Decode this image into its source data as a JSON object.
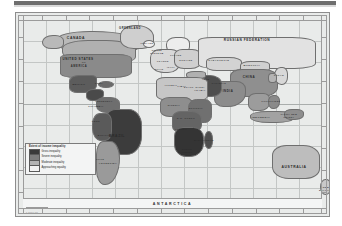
{
  "document": {
    "type": "world-choropleth-map",
    "subject": "Extent of income inequality"
  },
  "topbar": {
    "present": true
  },
  "legend": {
    "title": "Extent of income inequality",
    "entries": [
      {
        "label": "Gross inequality",
        "color": "#3a3a3a"
      },
      {
        "label": "Severe inequality",
        "color": "#7c7c7c"
      },
      {
        "label": "Moderate inequality",
        "color": "#b4b4b4"
      },
      {
        "label": "Approaching equality",
        "color": "#f2f2f2"
      }
    ]
  },
  "map": {
    "background_color": "#e9ebea",
    "graticule_color": "#c3c6c5",
    "antarctica_label": "ANTARCTICA",
    "scale_credit": "0        2000 km",
    "source_credit": "",
    "labels": [
      {
        "text": "CANADA",
        "x": 60,
        "y": 26,
        "size": 3.4
      },
      {
        "text": "UNITED STATES",
        "x": 62,
        "y": 46,
        "size": 3.0
      },
      {
        "text": "OF",
        "x": 68,
        "y": 50,
        "size": 2.4
      },
      {
        "text": "AMERICA",
        "x": 63,
        "y": 54,
        "size": 2.6
      },
      {
        "text": "GREENLAND",
        "x": 114,
        "y": 16,
        "size": 2.6
      },
      {
        "text": "ICELAND",
        "x": 131,
        "y": 30,
        "size": 2.0
      },
      {
        "text": "MEXICO",
        "x": 63,
        "y": 72,
        "size": 2.4
      },
      {
        "text": "CUBA",
        "x": 83,
        "y": 70,
        "size": 2.0
      },
      {
        "text": "VENEZUELA",
        "x": 88,
        "y": 88,
        "size": 2.0
      },
      {
        "text": "COLOMBIA",
        "x": 80,
        "y": 93,
        "size": 2.0
      },
      {
        "text": "PERU",
        "x": 80,
        "y": 108,
        "size": 2.0
      },
      {
        "text": "BRAZIL",
        "x": 101,
        "y": 124,
        "size": 3.4
      },
      {
        "text": "BOLIVIA",
        "x": 88,
        "y": 122,
        "size": 2.0
      },
      {
        "text": "CHILE",
        "x": 84,
        "y": 146,
        "size": 2.0
      },
      {
        "text": "ARGENTINA",
        "x": 92,
        "y": 150,
        "size": 2.2
      },
      {
        "text": "UNITED",
        "x": 141,
        "y": 38,
        "size": 1.9
      },
      {
        "text": "KINGDOM",
        "x": 141,
        "y": 41,
        "size": 1.9
      },
      {
        "text": "FRANCE",
        "x": 147,
        "y": 48,
        "size": 2.0
      },
      {
        "text": "SPAIN",
        "x": 143,
        "y": 56,
        "size": 2.0
      },
      {
        "text": "ITALY",
        "x": 155,
        "y": 55,
        "size": 1.9
      },
      {
        "text": "POLAND",
        "x": 160,
        "y": 43,
        "size": 1.9
      },
      {
        "text": "UKRAINE",
        "x": 170,
        "y": 47,
        "size": 2.0
      },
      {
        "text": "RUSSIAN FEDERATION",
        "x": 231,
        "y": 28,
        "size": 3.2
      },
      {
        "text": "KAZAKHSTAN",
        "x": 203,
        "y": 47,
        "size": 2.2
      },
      {
        "text": "MONGOLIA",
        "x": 236,
        "y": 52,
        "size": 2.2
      },
      {
        "text": "CHINA",
        "x": 233,
        "y": 64,
        "size": 3.0
      },
      {
        "text": "JAPAN",
        "x": 263,
        "y": 62,
        "size": 2.2
      },
      {
        "text": "INDIA",
        "x": 212,
        "y": 78,
        "size": 2.8
      },
      {
        "text": "PAKISTAN",
        "x": 203,
        "y": 70,
        "size": 2.0
      },
      {
        "text": "IRAN",
        "x": 190,
        "y": 66,
        "size": 2.0
      },
      {
        "text": "SAUDI",
        "x": 184,
        "y": 74,
        "size": 2.0
      },
      {
        "text": "ARABIA",
        "x": 184,
        "y": 77,
        "size": 2.0
      },
      {
        "text": "EGYPT",
        "x": 173,
        "y": 74,
        "size": 2.0
      },
      {
        "text": "ALGERIA",
        "x": 155,
        "y": 72,
        "size": 2.0
      },
      {
        "text": "LIBYA",
        "x": 166,
        "y": 73,
        "size": 2.0
      },
      {
        "text": "NIGERIA",
        "x": 158,
        "y": 92,
        "size": 2.0
      },
      {
        "text": "ETHIOPIA",
        "x": 180,
        "y": 95,
        "size": 2.0
      },
      {
        "text": "D.R. CONGO",
        "x": 170,
        "y": 105,
        "size": 2.0
      },
      {
        "text": "ANGOLA",
        "x": 165,
        "y": 116,
        "size": 2.0
      },
      {
        "text": "SOUTH",
        "x": 171,
        "y": 136,
        "size": 2.0
      },
      {
        "text": "AFRICA",
        "x": 171,
        "y": 139,
        "size": 2.0
      },
      {
        "text": "MADAGASCAR",
        "x": 188,
        "y": 128,
        "size": 1.9
      },
      {
        "text": "INDONESIA",
        "x": 245,
        "y": 105,
        "size": 2.4
      },
      {
        "text": "PHILIPPINES",
        "x": 255,
        "y": 88,
        "size": 2.0
      },
      {
        "text": "PAPUA NEW",
        "x": 273,
        "y": 102,
        "size": 1.9
      },
      {
        "text": "GUINEA",
        "x": 273,
        "y": 105,
        "size": 1.9
      },
      {
        "text": "AUSTRALIA",
        "x": 278,
        "y": 155,
        "size": 3.4
      },
      {
        "text": "NEW",
        "x": 310,
        "y": 174,
        "size": 2.0
      },
      {
        "text": "ZEALAND",
        "x": 310,
        "y": 177,
        "size": 2.0
      }
    ]
  },
  "regions": [
    {
      "name": "north-canada",
      "x": 40,
      "y": 18,
      "w": 82,
      "h": 20,
      "r": "40% 55% 30% 45%",
      "fill": "#b9b9b9"
    },
    {
      "name": "canada-main",
      "x": 46,
      "y": 27,
      "w": 72,
      "h": 22,
      "r": "35% 40% 30% 50%",
      "fill": "#b0b0b0"
    },
    {
      "name": "alaska",
      "x": 26,
      "y": 22,
      "w": 20,
      "h": 12,
      "r": "50% 40% 35% 45%",
      "fill": "#b9b9b9"
    },
    {
      "name": "greenland",
      "x": 104,
      "y": 12,
      "w": 32,
      "h": 22,
      "r": "45% 50% 35% 40%",
      "fill": "#cfcfcf"
    },
    {
      "name": "united-states",
      "x": 44,
      "y": 41,
      "w": 70,
      "h": 22,
      "r": "15% 20% 25% 20%",
      "fill": "#8a8a8a"
    },
    {
      "name": "mexico",
      "x": 53,
      "y": 62,
      "w": 26,
      "h": 16,
      "r": "35% 20% 45% 30%",
      "fill": "#5c5c5c"
    },
    {
      "name": "central-america",
      "x": 70,
      "y": 76,
      "w": 16,
      "h": 10,
      "r": "40% 30% 50% 35%",
      "fill": "#4a4a4a"
    },
    {
      "name": "caribbean",
      "x": 82,
      "y": 68,
      "w": 14,
      "h": 5,
      "r": "50%",
      "fill": "#6a6a6a"
    },
    {
      "name": "colombia-venezuela",
      "x": 80,
      "y": 84,
      "w": 22,
      "h": 14,
      "r": "35% 40% 30% 45%",
      "fill": "#6e6e6e"
    },
    {
      "name": "brazil",
      "x": 88,
      "y": 96,
      "w": 36,
      "h": 44,
      "r": "30% 35% 40% 45%",
      "fill": "#3c3c3c"
    },
    {
      "name": "peru-bolivia",
      "x": 76,
      "y": 100,
      "w": 18,
      "h": 26,
      "r": "40% 30% 35% 45%",
      "fill": "#5a5a5a"
    },
    {
      "name": "argentina-chile",
      "x": 80,
      "y": 128,
      "w": 22,
      "h": 42,
      "r": "35% 45% 70% 40%",
      "fill": "#9a9a9a"
    },
    {
      "name": "iceland",
      "x": 127,
      "y": 27,
      "w": 10,
      "h": 6,
      "r": "50%",
      "fill": "#efefef"
    },
    {
      "name": "scandinavia",
      "x": 150,
      "y": 24,
      "w": 22,
      "h": 16,
      "r": "40% 35% 45% 50%",
      "fill": "#ededed"
    },
    {
      "name": "western-europe",
      "x": 134,
      "y": 36,
      "w": 28,
      "h": 22,
      "r": "35% 30% 40% 45%",
      "fill": "#d8d8d8"
    },
    {
      "name": "eastern-europe",
      "x": 158,
      "y": 36,
      "w": 26,
      "h": 18,
      "r": "30% 35% 40% 35%",
      "fill": "#cfcfcf"
    },
    {
      "name": "russian-federation",
      "x": 182,
      "y": 24,
      "w": 116,
      "h": 30,
      "r": "12% 20% 18% 15%",
      "fill": "#e2e2e2"
    },
    {
      "name": "kazakhstan",
      "x": 190,
      "y": 44,
      "w": 34,
      "h": 12,
      "r": "30% 35% 25% 30%",
      "fill": "#d3d3d3"
    },
    {
      "name": "mongolia",
      "x": 224,
      "y": 48,
      "w": 28,
      "h": 10,
      "r": "35% 30% 35% 30%",
      "fill": "#d0d0d0"
    },
    {
      "name": "china",
      "x": 214,
      "y": 56,
      "w": 46,
      "h": 26,
      "r": "25% 30% 35% 25%",
      "fill": "#8f8f8f"
    },
    {
      "name": "japan",
      "x": 258,
      "y": 54,
      "w": 12,
      "h": 16,
      "r": "50% 40% 45% 55%",
      "fill": "#d8d8d8"
    },
    {
      "name": "korea",
      "x": 252,
      "y": 60,
      "w": 7,
      "h": 8,
      "r": "40%",
      "fill": "#b4b4b4"
    },
    {
      "name": "india",
      "x": 198,
      "y": 68,
      "w": 30,
      "h": 24,
      "r": "25% 30% 55% 30%",
      "fill": "#8c8c8c"
    },
    {
      "name": "middle-east",
      "x": 176,
      "y": 62,
      "w": 28,
      "h": 20,
      "r": "30% 40% 35% 30%",
      "fill": "#4e4e4e"
    },
    {
      "name": "turkey",
      "x": 170,
      "y": 58,
      "w": 18,
      "h": 6,
      "r": "40% 30% 35% 40%",
      "fill": "#b0b0b0"
    },
    {
      "name": "north-africa",
      "x": 140,
      "y": 64,
      "w": 50,
      "h": 22,
      "r": "18% 22% 20% 25%",
      "fill": "#c6c6c6"
    },
    {
      "name": "west-africa",
      "x": 144,
      "y": 84,
      "w": 30,
      "h": 18,
      "r": "30% 25% 35% 30%",
      "fill": "#8e8e8e"
    },
    {
      "name": "east-africa",
      "x": 172,
      "y": 86,
      "w": 22,
      "h": 22,
      "r": "35% 30% 30% 40%",
      "fill": "#707070"
    },
    {
      "name": "central-africa",
      "x": 156,
      "y": 98,
      "w": 28,
      "h": 20,
      "r": "30% 35% 35% 30%",
      "fill": "#646464"
    },
    {
      "name": "southern-africa",
      "x": 158,
      "y": 114,
      "w": 28,
      "h": 28,
      "r": "30% 35% 45% 40%",
      "fill": "#343434"
    },
    {
      "name": "madagascar",
      "x": 188,
      "y": 118,
      "w": 7,
      "h": 16,
      "r": "50% 45% 45% 50%",
      "fill": "#4e4e4e"
    },
    {
      "name": "southeast-asia",
      "x": 232,
      "y": 80,
      "w": 20,
      "h": 16,
      "r": "35% 30% 45% 35%",
      "fill": "#9c9c9c"
    },
    {
      "name": "philippines",
      "x": 252,
      "y": 82,
      "w": 10,
      "h": 12,
      "r": "45% 40% 50% 45%",
      "fill": "#8a8a8a"
    },
    {
      "name": "indonesia",
      "x": 234,
      "y": 98,
      "w": 42,
      "h": 10,
      "r": "40% 35% 40% 45%",
      "fill": "#a2a2a2"
    },
    {
      "name": "papua-new-guinea",
      "x": 268,
      "y": 96,
      "w": 18,
      "h": 9,
      "r": "40% 35% 45% 40%",
      "fill": "#8e8e8e"
    },
    {
      "name": "australia",
      "x": 256,
      "y": 132,
      "w": 46,
      "h": 32,
      "r": "30% 35% 30% 35%",
      "fill": "#bdbdbd"
    },
    {
      "name": "new-zealand",
      "x": 304,
      "y": 166,
      "w": 9,
      "h": 14,
      "r": "50% 40% 45% 50%",
      "fill": "#c9c9c9"
    }
  ]
}
